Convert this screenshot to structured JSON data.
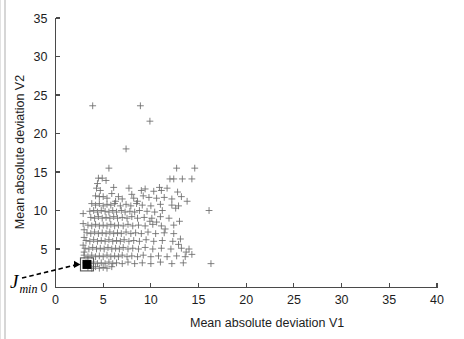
{
  "figure": {
    "background": "#ffffff",
    "marker_color": "#6b6b6b",
    "axis_color": "#4a4a4a",
    "highlight_color": "#000000"
  },
  "labels": {
    "xlabel": "Mean absolute deviation V1",
    "ylabel": "Mean absolute deviation V2",
    "annotation_main": "J",
    "annotation_sub": "min"
  },
  "chart_data": {
    "type": "scatter",
    "title": "",
    "xlabel": "Mean absolute deviation V1",
    "ylabel": "Mean absolute deviation V2",
    "xlim": [
      0,
      40
    ],
    "ylim": [
      0,
      35
    ],
    "xticks": [
      0,
      5,
      10,
      15,
      20,
      25,
      30,
      35,
      40
    ],
    "yticks": [
      0,
      5,
      10,
      15,
      20,
      25,
      30,
      35
    ],
    "xticklabels": [
      "0",
      "5",
      "10",
      "15",
      "20",
      "25",
      "30",
      "35",
      "40"
    ],
    "yticklabels": [
      "0",
      "5",
      "10",
      "15",
      "20",
      "25",
      "30",
      "35"
    ],
    "grid": false,
    "legend": null,
    "marker": "+",
    "annotations": [
      {
        "text": "J_min",
        "display": "J",
        "subscript": "min",
        "point_x": 3.3,
        "point_y": 3.0,
        "marker": "filled-square",
        "arrow": "dashed"
      }
    ],
    "series": [
      {
        "name": "solutions",
        "marker": "+",
        "color": "#6b6b6b",
        "points": [
          [
            3.3,
            3.0
          ],
          [
            3.9,
            23.6
          ],
          [
            8.9,
            23.6
          ],
          [
            9.9,
            21.6
          ],
          [
            7.4,
            18.0
          ],
          [
            5.6,
            15.5
          ],
          [
            12.7,
            15.5
          ],
          [
            14.6,
            15.5
          ],
          [
            4.5,
            14.2
          ],
          [
            4.9,
            14.2
          ],
          [
            5.3,
            13.9
          ],
          [
            12.0,
            14.1
          ],
          [
            12.4,
            14.1
          ],
          [
            13.3,
            14.1
          ],
          [
            14.3,
            14.1
          ],
          [
            4.3,
            12.9
          ],
          [
            4.7,
            12.6
          ],
          [
            6.1,
            13.0
          ],
          [
            7.7,
            12.9
          ],
          [
            9.0,
            12.6
          ],
          [
            9.4,
            12.8
          ],
          [
            10.3,
            12.5
          ],
          [
            11.1,
            12.6
          ],
          [
            4.2,
            11.9
          ],
          [
            4.6,
            11.8
          ],
          [
            5.0,
            11.8
          ],
          [
            5.4,
            11.6
          ],
          [
            6.6,
            11.8
          ],
          [
            7.0,
            11.5
          ],
          [
            8.2,
            11.6
          ],
          [
            9.2,
            11.9
          ],
          [
            9.8,
            11.7
          ],
          [
            10.6,
            11.6
          ],
          [
            11.4,
            11.7
          ],
          [
            12.2,
            11.5
          ],
          [
            13.2,
            11.8
          ],
          [
            3.8,
            10.9
          ],
          [
            4.2,
            10.7
          ],
          [
            4.6,
            10.9
          ],
          [
            5.0,
            10.6
          ],
          [
            5.4,
            10.8
          ],
          [
            5.8,
            10.7
          ],
          [
            6.2,
            10.9
          ],
          [
            6.8,
            10.6
          ],
          [
            7.4,
            10.8
          ],
          [
            7.9,
            10.6
          ],
          [
            8.5,
            10.9
          ],
          [
            9.1,
            10.7
          ],
          [
            10.0,
            10.6
          ],
          [
            11.0,
            10.8
          ],
          [
            12.2,
            10.7
          ],
          [
            12.9,
            10.6
          ],
          [
            3.6,
            9.9
          ],
          [
            4.0,
            10.0
          ],
          [
            4.4,
            9.8
          ],
          [
            4.8,
            10.0
          ],
          [
            5.2,
            9.9
          ],
          [
            5.6,
            9.8
          ],
          [
            6.0,
            10.0
          ],
          [
            6.4,
            9.8
          ],
          [
            6.9,
            10.0
          ],
          [
            7.3,
            9.8
          ],
          [
            7.8,
            9.9
          ],
          [
            8.3,
            9.8
          ],
          [
            8.8,
            10.0
          ],
          [
            9.6,
            9.9
          ],
          [
            10.4,
            9.8
          ],
          [
            11.2,
            10.0
          ],
          [
            16.1,
            10.0
          ],
          [
            3.7,
            9.1
          ],
          [
            4.1,
            9.0
          ],
          [
            4.5,
            9.2
          ],
          [
            4.9,
            9.0
          ],
          [
            5.3,
            9.1
          ],
          [
            5.7,
            9.0
          ],
          [
            6.1,
            9.2
          ],
          [
            6.5,
            9.0
          ],
          [
            7.0,
            9.1
          ],
          [
            7.5,
            9.0
          ],
          [
            8.0,
            9.2
          ],
          [
            8.6,
            9.0
          ],
          [
            9.3,
            9.1
          ],
          [
            10.1,
            9.0
          ],
          [
            11.0,
            9.2
          ],
          [
            11.9,
            9.0
          ],
          [
            3.4,
            8.1
          ],
          [
            3.8,
            8.0
          ],
          [
            4.2,
            8.2
          ],
          [
            4.6,
            8.0
          ],
          [
            5.0,
            8.1
          ],
          [
            5.4,
            8.0
          ],
          [
            5.8,
            8.2
          ],
          [
            6.2,
            8.0
          ],
          [
            6.6,
            8.1
          ],
          [
            7.1,
            8.0
          ],
          [
            7.6,
            8.2
          ],
          [
            8.1,
            8.0
          ],
          [
            8.7,
            8.1
          ],
          [
            9.4,
            8.0
          ],
          [
            10.2,
            8.2
          ],
          [
            11.1,
            8.0
          ],
          [
            12.4,
            8.1
          ],
          [
            3.3,
            7.1
          ],
          [
            3.7,
            7.0
          ],
          [
            4.1,
            7.2
          ],
          [
            4.5,
            7.0
          ],
          [
            4.9,
            7.1
          ],
          [
            5.3,
            7.0
          ],
          [
            5.7,
            7.2
          ],
          [
            6.1,
            7.0
          ],
          [
            6.5,
            7.1
          ],
          [
            6.9,
            7.0
          ],
          [
            7.4,
            7.2
          ],
          [
            7.9,
            7.0
          ],
          [
            8.4,
            7.1
          ],
          [
            9.0,
            7.0
          ],
          [
            9.7,
            7.2
          ],
          [
            10.5,
            7.0
          ],
          [
            11.4,
            7.1
          ],
          [
            3.2,
            6.1
          ],
          [
            3.6,
            6.0
          ],
          [
            4.0,
            6.2
          ],
          [
            4.4,
            6.0
          ],
          [
            4.8,
            6.1
          ],
          [
            5.2,
            6.0
          ],
          [
            5.6,
            6.2
          ],
          [
            6.0,
            6.0
          ],
          [
            6.4,
            6.1
          ],
          [
            6.8,
            6.0
          ],
          [
            7.2,
            6.2
          ],
          [
            7.7,
            6.0
          ],
          [
            8.2,
            6.1
          ],
          [
            8.8,
            6.0
          ],
          [
            9.5,
            6.2
          ],
          [
            10.3,
            6.0
          ],
          [
            11.2,
            6.1
          ],
          [
            12.3,
            6.0
          ],
          [
            3.1,
            5.1
          ],
          [
            3.5,
            5.0
          ],
          [
            3.9,
            5.2
          ],
          [
            4.3,
            5.0
          ],
          [
            4.7,
            5.1
          ],
          [
            5.1,
            5.0
          ],
          [
            5.5,
            5.2
          ],
          [
            5.9,
            5.0
          ],
          [
            6.3,
            5.1
          ],
          [
            6.7,
            5.0
          ],
          [
            7.1,
            5.2
          ],
          [
            7.6,
            5.0
          ],
          [
            8.1,
            5.1
          ],
          [
            8.7,
            5.0
          ],
          [
            9.4,
            5.2
          ],
          [
            10.2,
            5.0
          ],
          [
            11.1,
            5.1
          ],
          [
            12.1,
            5.0
          ],
          [
            13.2,
            5.1
          ],
          [
            3.0,
            4.2
          ],
          [
            3.4,
            4.0
          ],
          [
            3.8,
            4.2
          ],
          [
            4.2,
            4.0
          ],
          [
            4.6,
            4.1
          ],
          [
            5.0,
            4.0
          ],
          [
            5.4,
            4.2
          ],
          [
            5.8,
            4.0
          ],
          [
            6.2,
            4.1
          ],
          [
            6.6,
            4.0
          ],
          [
            7.0,
            4.2
          ],
          [
            7.5,
            4.0
          ],
          [
            8.0,
            4.1
          ],
          [
            8.6,
            4.0
          ],
          [
            9.2,
            4.2
          ],
          [
            10.0,
            4.0
          ],
          [
            10.8,
            4.1
          ],
          [
            11.7,
            4.0
          ],
          [
            12.7,
            4.1
          ],
          [
            13.6,
            4.0
          ],
          [
            3.2,
            3.2
          ],
          [
            3.6,
            3.1
          ],
          [
            4.0,
            3.3
          ],
          [
            4.4,
            3.1
          ],
          [
            4.8,
            3.2
          ],
          [
            5.2,
            3.1
          ],
          [
            5.6,
            3.3
          ],
          [
            6.0,
            3.1
          ],
          [
            6.4,
            3.2
          ],
          [
            7.0,
            3.1
          ],
          [
            7.6,
            3.3
          ],
          [
            8.3,
            3.1
          ],
          [
            9.1,
            3.2
          ],
          [
            10.0,
            3.1
          ],
          [
            11.0,
            3.3
          ],
          [
            12.2,
            3.1
          ],
          [
            13.4,
            3.2
          ],
          [
            16.3,
            3.1
          ],
          [
            3.4,
            2.6
          ],
          [
            3.8,
            2.5
          ],
          [
            4.2,
            2.7
          ],
          [
            4.6,
            2.5
          ],
          [
            5.0,
            2.6
          ],
          [
            5.4,
            2.5
          ],
          [
            5.9,
            2.7
          ],
          [
            2.9,
            9.6
          ],
          [
            2.9,
            8.3
          ],
          [
            3.0,
            7.5
          ],
          [
            3.0,
            6.5
          ],
          [
            2.9,
            5.5
          ],
          [
            3.0,
            4.6
          ],
          [
            4.4,
            13.5
          ],
          [
            5.9,
            12.2
          ],
          [
            6.3,
            11.2
          ],
          [
            8.0,
            12.1
          ],
          [
            8.6,
            11.2
          ],
          [
            10.9,
            13.0
          ],
          [
            11.7,
            12.9
          ],
          [
            12.8,
            12.4
          ],
          [
            13.8,
            11.2
          ],
          [
            12.6,
            10.3
          ],
          [
            9.9,
            8.6
          ],
          [
            10.6,
            8.5
          ],
          [
            11.5,
            7.6
          ],
          [
            12.4,
            7.0
          ],
          [
            13.0,
            8.6
          ],
          [
            13.1,
            6.3
          ],
          [
            12.9,
            5.6
          ],
          [
            13.7,
            4.6
          ],
          [
            14.3,
            4.3
          ],
          [
            14.0,
            5.0
          ]
        ]
      }
    ]
  }
}
